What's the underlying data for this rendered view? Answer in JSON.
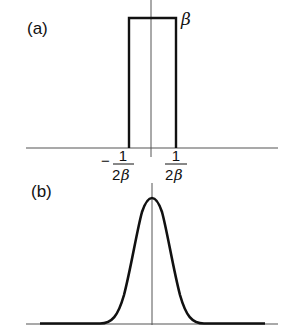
{
  "figure": {
    "panel_a": {
      "label": "(a)",
      "height_label": "β",
      "tick_left": {
        "sign": "−",
        "numerator": "1",
        "denominator_num": "2",
        "denominator_sym": "β"
      },
      "tick_right": {
        "numerator": "1",
        "denominator_num": "2",
        "denominator_sym": "β"
      },
      "shape": "rectangular pulse"
    },
    "panel_b": {
      "label": "(b)",
      "shape": "gaussian bell curve"
    },
    "colors": {
      "line": "#111111",
      "axis": "#555555",
      "background": "#ffffff"
    }
  }
}
